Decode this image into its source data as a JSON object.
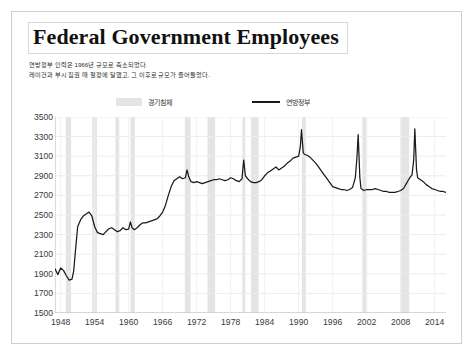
{
  "figure": {
    "title": "Federal Government Employees",
    "subtitle_lines": [
      "연방정부 인력은 1966년 규모로 축소되었다.",
      "레이건과 부시 집권 때 절정에 달했고, 그 이후로 규모가 줄어들었다."
    ],
    "border_color": "#cfcfcf"
  },
  "legend": {
    "recession_label": "경기침체",
    "federal_label": "연방정부",
    "recession_color": "#e4e4e4",
    "line_color": "#1a1a1a"
  },
  "chart_data": {
    "type": "line",
    "title": "Federal Government Employees",
    "subtitle": "연방정부 인력은 1966년 규모로 축소되었다. 레이건과 부시 집권 때 절정에 달했고, 그 이후로 규모가 줄어들었다.",
    "xlabel": "",
    "ylabel": "",
    "unit": "thousands of persons",
    "grid": true,
    "legend_position": "top",
    "xlim": [
      1947.0,
      2016.0
    ],
    "ylim": [
      1500,
      3500
    ],
    "yticks": [
      1500,
      1700,
      1900,
      2100,
      2300,
      2500,
      2700,
      2900,
      3100,
      3300,
      3500
    ],
    "xticks": [
      1948,
      1954,
      1960,
      1966,
      1972,
      1978,
      1984,
      1990,
      1996,
      2002,
      2008,
      2014
    ],
    "series": [
      {
        "name": "연방정부",
        "color": "#1a1a1a",
        "x": [
          1947.0,
          1947.5,
          1948.0,
          1948.5,
          1949.0,
          1949.5,
          1950.0,
          1950.3,
          1950.6,
          1951.0,
          1951.5,
          1952.0,
          1952.5,
          1953.0,
          1953.5,
          1954.0,
          1954.5,
          1955.0,
          1955.5,
          1956.0,
          1956.5,
          1957.0,
          1957.5,
          1958.0,
          1958.5,
          1959.0,
          1959.5,
          1960.0,
          1960.3,
          1960.6,
          1961.0,
          1961.5,
          1962.0,
          1962.5,
          1963.0,
          1963.5,
          1964.0,
          1964.5,
          1965.0,
          1965.5,
          1966.0,
          1966.5,
          1967.0,
          1967.5,
          1968.0,
          1968.5,
          1969.0,
          1969.5,
          1970.0,
          1970.3,
          1970.6,
          1971.0,
          1971.5,
          1972.0,
          1972.5,
          1973.0,
          1973.5,
          1974.0,
          1974.5,
          1975.0,
          1975.5,
          1976.0,
          1976.5,
          1977.0,
          1977.5,
          1978.0,
          1978.5,
          1979.0,
          1979.5,
          1980.0,
          1980.3,
          1980.6,
          1981.0,
          1981.5,
          1982.0,
          1982.5,
          1983.0,
          1983.5,
          1984.0,
          1984.5,
          1985.0,
          1985.5,
          1986.0,
          1986.5,
          1987.0,
          1987.5,
          1988.0,
          1988.5,
          1989.0,
          1989.5,
          1990.0,
          1990.3,
          1990.5,
          1990.8,
          1991.0,
          1991.5,
          1992.0,
          1992.5,
          1993.0,
          1993.5,
          1994.0,
          1994.5,
          1995.0,
          1995.5,
          1996.0,
          1996.5,
          1997.0,
          1997.5,
          1998.0,
          1998.5,
          1999.0,
          1999.5,
          2000.0,
          2000.3,
          2000.5,
          2000.8,
          2001.0,
          2001.5,
          2002.0,
          2002.5,
          2003.0,
          2003.5,
          2004.0,
          2004.5,
          2005.0,
          2005.5,
          2006.0,
          2006.5,
          2007.0,
          2007.5,
          2008.0,
          2008.5,
          2009.0,
          2009.5,
          2010.0,
          2010.3,
          2010.5,
          2010.8,
          2011.0,
          2011.5,
          2012.0,
          2012.5,
          2013.0,
          2013.5,
          2014.0,
          2014.5,
          2015.0,
          2015.5,
          2016.0
        ],
        "y": [
          1950,
          1892,
          1960,
          1935,
          1880,
          1835,
          1845,
          1930,
          2130,
          2380,
          2450,
          2490,
          2510,
          2530,
          2490,
          2380,
          2320,
          2310,
          2300,
          2330,
          2360,
          2370,
          2350,
          2330,
          2340,
          2370,
          2350,
          2355,
          2430,
          2370,
          2350,
          2370,
          2400,
          2420,
          2420,
          2430,
          2440,
          2450,
          2460,
          2490,
          2530,
          2600,
          2700,
          2790,
          2850,
          2870,
          2890,
          2870,
          2880,
          2960,
          2890,
          2840,
          2830,
          2840,
          2830,
          2820,
          2830,
          2840,
          2850,
          2860,
          2860,
          2870,
          2860,
          2850,
          2860,
          2880,
          2870,
          2850,
          2840,
          2870,
          3060,
          2900,
          2870,
          2840,
          2830,
          2830,
          2840,
          2860,
          2900,
          2930,
          2950,
          2970,
          2990,
          2960,
          2980,
          3000,
          3030,
          3050,
          3080,
          3090,
          3100,
          3200,
          3370,
          3140,
          3120,
          3110,
          3090,
          3060,
          3030,
          2990,
          2950,
          2910,
          2870,
          2830,
          2790,
          2780,
          2770,
          2760,
          2760,
          2750,
          2760,
          2780,
          2880,
          3100,
          3320,
          2880,
          2770,
          2750,
          2760,
          2760,
          2760,
          2770,
          2760,
          2750,
          2740,
          2740,
          2730,
          2730,
          2730,
          2740,
          2750,
          2770,
          2820,
          2870,
          2910,
          3060,
          3380,
          2960,
          2880,
          2860,
          2840,
          2810,
          2790,
          2770,
          2760,
          2750,
          2740,
          2740,
          2730
        ]
      }
    ],
    "recession_bands": [
      {
        "start": 1948.92,
        "end": 1949.83
      },
      {
        "start": 1953.58,
        "end": 1954.42
      },
      {
        "start": 1957.67,
        "end": 1958.33
      },
      {
        "start": 1960.33,
        "end": 1961.08
      },
      {
        "start": 1969.92,
        "end": 1970.92
      },
      {
        "start": 1973.92,
        "end": 1975.25
      },
      {
        "start": 1980.08,
        "end": 1980.58
      },
      {
        "start": 1981.58,
        "end": 1982.92
      },
      {
        "start": 1990.58,
        "end": 1991.25
      },
      {
        "start": 2001.25,
        "end": 2001.92
      },
      {
        "start": 2007.92,
        "end": 2009.5
      }
    ]
  }
}
